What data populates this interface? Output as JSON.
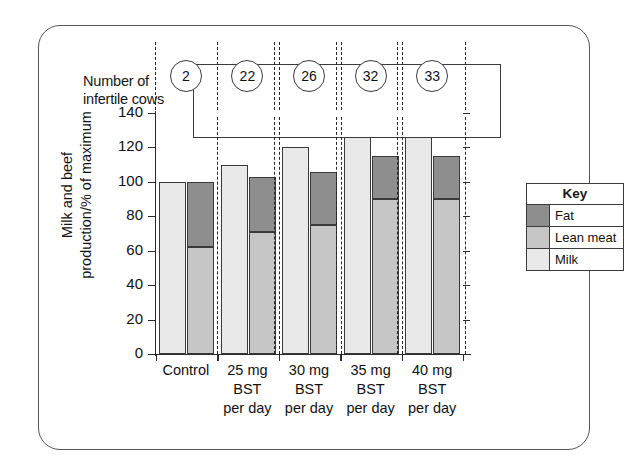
{
  "figure": {
    "border_color": "#555555"
  },
  "cow_row": {
    "label_line1": "Number of",
    "label_line2": "infertile cows",
    "values": [
      "2",
      "22",
      "26",
      "32",
      "33"
    ]
  },
  "legend": {
    "title": "Key",
    "items": [
      {
        "label": "Fat",
        "color": "#8e8e8e"
      },
      {
        "label": "Lean meat",
        "color": "#c6c6c6"
      },
      {
        "label": "Milk",
        "color": "#e9e9e9"
      }
    ]
  },
  "axis": {
    "y_title_line1": "Milk and beef",
    "y_title_line2": "production/% of maximum",
    "y_ticks": [
      "0",
      "20",
      "40",
      "60",
      "80",
      "100",
      "120",
      "140"
    ]
  },
  "x_groups": [
    {
      "line1": "Control",
      "line2": "",
      "line3": ""
    },
    {
      "line1": "25 mg",
      "line2": "BST",
      "line3": "per day"
    },
    {
      "line1": "30 mg",
      "line2": "BST",
      "line3": "per day"
    },
    {
      "line1": "35 mg",
      "line2": "BST",
      "line3": "per day"
    },
    {
      "line1": "40 mg",
      "line2": "BST",
      "line3": "per day"
    }
  ],
  "chart_data": {
    "type": "bar",
    "title": "",
    "subtitle": "",
    "xlabel": "",
    "ylabel": "Milk and beef production/% of maximum",
    "ylim": [
      0,
      140
    ],
    "yticks": [
      0,
      20,
      40,
      60,
      80,
      100,
      120,
      140
    ],
    "grid": false,
    "legend_position": "right",
    "legend_title": "Key",
    "categories": [
      "Control",
      "25 mg BST per day",
      "30 mg BST per day",
      "35 mg BST per day",
      "40 mg BST per day"
    ],
    "annotations": {
      "name": "Number of infertile cows",
      "values": [
        2,
        22,
        26,
        32,
        33
      ]
    },
    "bar_pairs": [
      {
        "category": "Control",
        "milk_bar": {
          "series": "Milk",
          "value": 100
        },
        "beef_bar": {
          "lean_meat": 62,
          "fat_top": 100,
          "fat": 38
        }
      },
      {
        "category": "25 mg BST per day",
        "milk_bar": {
          "series": "Milk",
          "value": 110
        },
        "beef_bar": {
          "lean_meat": 71,
          "fat_top": 103,
          "fat": 32
        }
      },
      {
        "category": "30 mg BST per day",
        "milk_bar": {
          "series": "Milk",
          "value": 120
        },
        "beef_bar": {
          "lean_meat": 75,
          "fat_top": 106,
          "fat": 31
        }
      },
      {
        "category": "35 mg BST per day",
        "milk_bar": {
          "series": "Milk",
          "value": 126
        },
        "beef_bar": {
          "lean_meat": 90,
          "fat_top": 115,
          "fat": 25
        }
      },
      {
        "category": "40 mg BST per day",
        "milk_bar": {
          "series": "Milk",
          "value": 126
        },
        "beef_bar": {
          "lean_meat": 90,
          "fat_top": 115,
          "fat": 25
        }
      }
    ],
    "series": [
      {
        "name": "Milk",
        "values": [
          100,
          110,
          120,
          126,
          126
        ]
      },
      {
        "name": "Lean meat",
        "values": [
          62,
          71,
          75,
          90,
          90
        ]
      },
      {
        "name": "Fat",
        "values": [
          38,
          32,
          31,
          25,
          25
        ]
      }
    ]
  }
}
